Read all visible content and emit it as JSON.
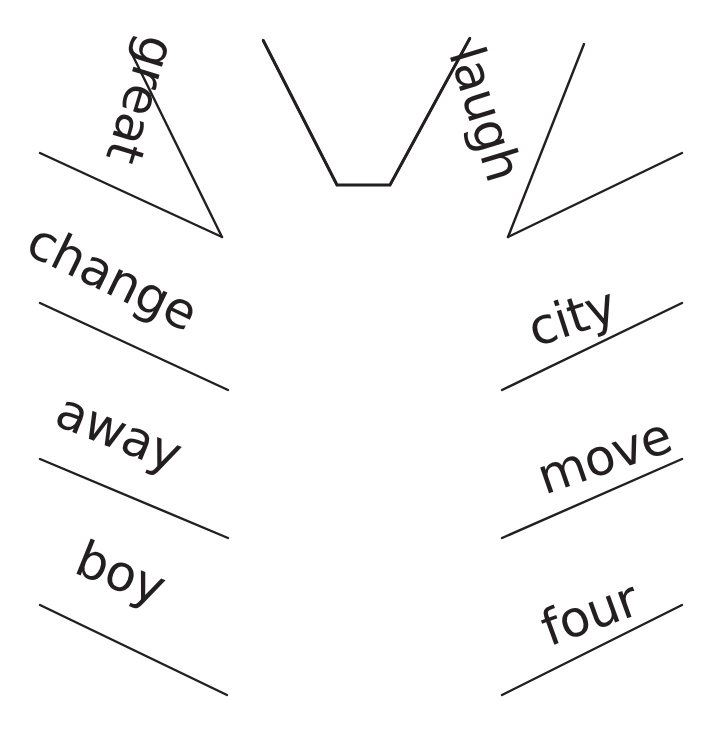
{
  "canvas": {
    "width": 718,
    "height": 733,
    "background": "#ffffff",
    "ink_color": "#231f20"
  },
  "diagram": {
    "type": "radial-word-fan",
    "center": {
      "x": 365,
      "y": 400
    },
    "notch": {
      "name": "center-trapezoid-notch",
      "points": "263,40 337,185 390,185 470,38"
    },
    "spokes": [
      {
        "name": "spoke-great-left",
        "x1": 132,
        "y1": 54,
        "x2": 222,
        "y2": 237
      },
      {
        "name": "spoke-great-right",
        "x1": 263,
        "y1": 40,
        "x2": 337,
        "y2": 185
      },
      {
        "name": "spoke-laugh-left",
        "x1": 470,
        "y1": 38,
        "x2": 390,
        "y2": 185
      },
      {
        "name": "spoke-laugh-right",
        "x1": 584,
        "y1": 44,
        "x2": 508,
        "y2": 237
      },
      {
        "name": "spoke-change-top",
        "x1": 40,
        "y1": 153,
        "x2": 222,
        "y2": 237
      },
      {
        "name": "spoke-change-bot",
        "x1": 40,
        "y1": 303,
        "x2": 228,
        "y2": 390
      },
      {
        "name": "spoke-away-bot",
        "x1": 40,
        "y1": 459,
        "x2": 228,
        "y2": 538
      },
      {
        "name": "spoke-boy-bot",
        "x1": 40,
        "y1": 605,
        "x2": 227,
        "y2": 695
      },
      {
        "name": "spoke-city-top",
        "x1": 682,
        "y1": 153,
        "x2": 508,
        "y2": 237
      },
      {
        "name": "spoke-city-bot",
        "x1": 682,
        "y1": 303,
        "x2": 502,
        "y2": 390
      },
      {
        "name": "spoke-move-bot",
        "x1": 682,
        "y1": 459,
        "x2": 502,
        "y2": 538
      },
      {
        "name": "spoke-four-bot",
        "x1": 682,
        "y1": 605,
        "x2": 502,
        "y2": 695
      }
    ],
    "words": [
      {
        "id": "great",
        "label": "great",
        "side": "left",
        "x": 184,
        "y": 45,
        "rotation": 107,
        "font_size": 50
      },
      {
        "id": "change",
        "label": "change",
        "side": "left",
        "x": 42,
        "y": 215,
        "rotation": 26,
        "font_size": 50
      },
      {
        "id": "away",
        "label": "away",
        "side": "left",
        "x": 68,
        "y": 385,
        "rotation": 22,
        "font_size": 50
      },
      {
        "id": "boy",
        "label": "boy",
        "side": "left",
        "x": 88,
        "y": 533,
        "rotation": 22,
        "font_size": 50
      },
      {
        "id": "laugh",
        "label": "laugh",
        "side": "right",
        "x": 489,
        "y": 41,
        "rotation": 73,
        "font_size": 50
      },
      {
        "id": "city",
        "label": "city",
        "side": "right",
        "x": 522,
        "y": 307,
        "rotation": -18,
        "font_size": 50
      },
      {
        "id": "move",
        "label": "move",
        "side": "right",
        "x": 531,
        "y": 455,
        "rotation": -19,
        "font_size": 50
      },
      {
        "id": "four",
        "label": "four",
        "side": "right",
        "x": 535,
        "y": 607,
        "rotation": -20,
        "font_size": 50
      }
    ]
  }
}
